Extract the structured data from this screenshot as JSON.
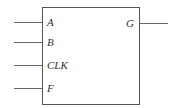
{
  "block": {
    "inputs": [
      {
        "label": "A",
        "y": 22
      },
      {
        "label": "B",
        "y": 42
      },
      {
        "label": "CLK",
        "y": 65
      },
      {
        "label": "F",
        "y": 88
      }
    ],
    "outputs": [
      {
        "label": "G",
        "y": 23
      }
    ]
  }
}
